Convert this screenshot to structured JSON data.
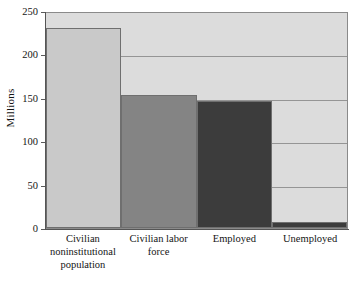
{
  "chart_data": {
    "type": "bar",
    "title": "",
    "subtitle": "",
    "xlabel": "",
    "ylabel": "Millions",
    "categories": [
      "Civilian noninstitutional population",
      "Civilian labor force",
      "Employed",
      "Unemployed"
    ],
    "category_lines": [
      [
        "Civilian",
        "noninstitutional",
        "population"
      ],
      [
        "Civilian labor",
        "force"
      ],
      [
        "Employed"
      ],
      [
        "Unemployed"
      ]
    ],
    "values": [
      230,
      153,
      146,
      7
    ],
    "ylim": [
      0,
      250
    ],
    "yticks": [
      0,
      50,
      100,
      150,
      200,
      250
    ],
    "ytick_labels": [
      "0",
      "50",
      "100",
      "150",
      "200",
      "250"
    ],
    "grid": "horizontal",
    "legend": "none",
    "bar_colors": [
      "#c9c9c9",
      "#848484",
      "#3c3c3c",
      "#3c3c3c"
    ],
    "plot_background": "#dcdcdc",
    "gridline_color": "#7d7d7d",
    "axis_color": "#555555",
    "bar_edge_color": "#6f6f6f"
  }
}
